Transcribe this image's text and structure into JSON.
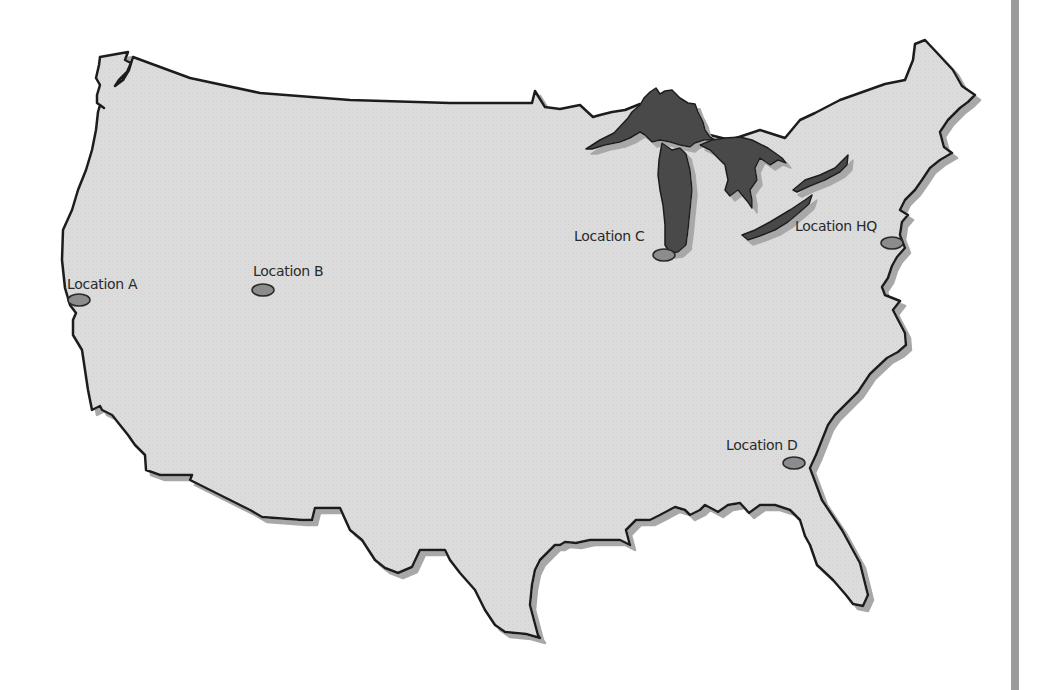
{
  "map": {
    "title": "United States locations map",
    "colors": {
      "land": "#dcdcdc",
      "outline": "#1e1e1e",
      "shadow": "#9c9c9c",
      "lakes": "#4a4a4a",
      "marker_fill": "#8c8c8c",
      "marker_stroke": "#2a2a2a",
      "side_bar": "#9a9a9a",
      "label_text": "#2a2a2a"
    },
    "locations": [
      {
        "id": "A",
        "label": "Location A",
        "marker": {
          "cx": 79,
          "cy": 300
        },
        "label_pos": {
          "x": 67,
          "y": 277
        }
      },
      {
        "id": "B",
        "label": "Location B",
        "marker": {
          "cx": 263,
          "cy": 290
        },
        "label_pos": {
          "x": 253,
          "y": 264
        }
      },
      {
        "id": "C",
        "label": "Location C",
        "marker": {
          "cx": 664,
          "cy": 255
        },
        "label_pos": {
          "x": 574,
          "y": 229
        }
      },
      {
        "id": "HQ",
        "label": "Location HQ",
        "marker": {
          "cx": 892,
          "cy": 243
        },
        "label_pos": {
          "x": 795,
          "y": 219
        }
      },
      {
        "id": "D",
        "label": "Location D",
        "marker": {
          "cx": 794,
          "cy": 463
        },
        "label_pos": {
          "x": 726,
          "y": 438
        }
      }
    ]
  }
}
